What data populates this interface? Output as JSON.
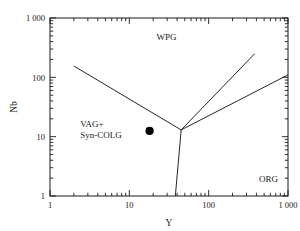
{
  "chart_data": {
    "type": "scatter",
    "title": "",
    "xlabel": "Y",
    "ylabel": "Nb",
    "xscale": "log",
    "yscale": "log",
    "xlim": [
      1,
      1000
    ],
    "ylim": [
      1,
      1000
    ],
    "grid": false,
    "legend": "none",
    "xticks": [
      {
        "value": 1,
        "label": "1"
      },
      {
        "value": 10,
        "label": "10"
      },
      {
        "value": 100,
        "label": "100"
      },
      {
        "value": 1000,
        "label": "1 000"
      }
    ],
    "yticks": [
      {
        "value": 1,
        "label": "1"
      },
      {
        "value": 10,
        "label": "10"
      },
      {
        "value": 100,
        "label": "100"
      },
      {
        "value": 1000,
        "label": "1 000"
      }
    ],
    "series": [
      {
        "name": "sample",
        "marker": "filled-circle",
        "color": "#000000",
        "points": [
          {
            "x": 18,
            "y": 12.5
          }
        ]
      }
    ],
    "boundaries": [
      {
        "name": "vag-wpg-boundary",
        "points": [
          [
            2.0,
            155
          ],
          [
            45,
            13
          ]
        ]
      },
      {
        "name": "wpg-org-boundary",
        "points": [
          [
            45,
            13
          ],
          [
            380,
            250
          ]
        ]
      },
      {
        "name": "vag-org-boundary",
        "points": [
          [
            45,
            13
          ],
          [
            1000,
            110
          ]
        ]
      },
      {
        "name": "vag-org-lower-boundary",
        "points": [
          [
            45,
            13
          ],
          [
            38,
            1
          ]
        ]
      }
    ],
    "annotations": [
      {
        "name": "field-wpg",
        "text": "WPG",
        "x": 22,
        "y": 420
      },
      {
        "name": "field-vag-line1",
        "text": "VAG+",
        "x": 2.4,
        "y": 14.5
      },
      {
        "name": "field-vag-line2",
        "text": "Syn-COLG",
        "x": 2.4,
        "y": 9.5
      },
      {
        "name": "field-org",
        "text": "ORG",
        "x": 430,
        "y": 1.75
      }
    ],
    "axis_titles": {
      "x": "Y",
      "y": "Nb"
    },
    "colors": {
      "line": "#1a1a1a",
      "marker": "#000000",
      "background": "#ffffff",
      "frame": "#1a1a1a"
    }
  }
}
